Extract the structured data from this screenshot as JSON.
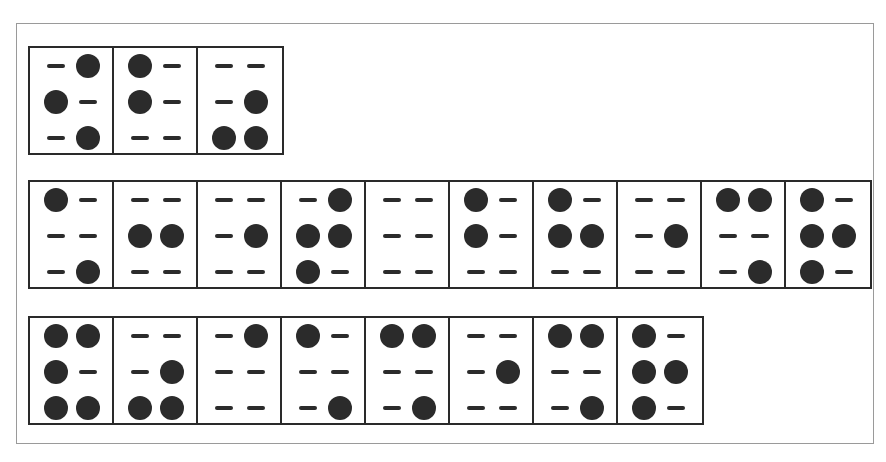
{
  "diagram": {
    "title": "",
    "encoding": "each cell = [row1-left, row1-right, row2-left, row2-right, row3-left, row3-right]; 1 = raised dot, 0 = dash",
    "colors": {
      "ink": "#2b2b2b",
      "frame": "#9a9a9a",
      "background": "#ffffff"
    },
    "rows": [
      {
        "cells": [
          [
            0,
            1,
            1,
            0,
            0,
            1
          ],
          [
            1,
            0,
            1,
            0,
            0,
            0
          ],
          [
            0,
            0,
            0,
            1,
            1,
            1
          ]
        ]
      },
      {
        "cells": [
          [
            1,
            0,
            0,
            0,
            0,
            1
          ],
          [
            0,
            0,
            1,
            1,
            0,
            0
          ],
          [
            0,
            0,
            0,
            1,
            0,
            0
          ],
          [
            0,
            1,
            1,
            1,
            1,
            0
          ],
          [
            0,
            0,
            0,
            0,
            0,
            0
          ],
          [
            1,
            0,
            1,
            0,
            0,
            0
          ],
          [
            1,
            0,
            1,
            1,
            0,
            0
          ],
          [
            0,
            0,
            0,
            1,
            0,
            0
          ],
          [
            1,
            1,
            0,
            0,
            0,
            1
          ],
          [
            1,
            0,
            1,
            1,
            1,
            0
          ]
        ]
      },
      {
        "cells": [
          [
            1,
            1,
            1,
            0,
            1,
            1
          ],
          [
            0,
            0,
            0,
            1,
            1,
            1
          ],
          [
            0,
            1,
            0,
            0,
            0,
            0
          ],
          [
            1,
            0,
            0,
            0,
            0,
            1
          ],
          [
            1,
            1,
            0,
            0,
            0,
            1
          ],
          [
            0,
            0,
            0,
            1,
            0,
            0
          ],
          [
            1,
            1,
            0,
            0,
            0,
            1
          ],
          [
            1,
            0,
            1,
            1,
            1,
            0
          ]
        ]
      }
    ]
  }
}
